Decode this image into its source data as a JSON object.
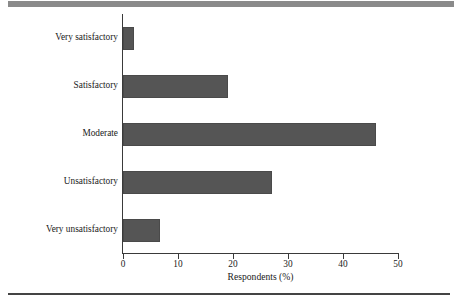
{
  "figure": {
    "background_color": "#ffffff",
    "rules": {
      "top_rule_color": "#8a8a8a",
      "bottom_rule_color": "#444444"
    }
  },
  "chart_data": {
    "type": "bar",
    "orientation": "horizontal",
    "title": "",
    "subtitle": "",
    "xlabel": "Respondents (%)",
    "ylabel": "",
    "categories": [
      "Very satisfactory",
      "Satisfactory",
      "Moderate",
      "Unsatisfactory",
      "Very unsatisfactory"
    ],
    "values": [
      2,
      19,
      46,
      27,
      6.7
    ],
    "xlim": [
      0,
      50
    ],
    "xticks": [
      0,
      10,
      20,
      30,
      40,
      50
    ],
    "xtick_labels": [
      "0",
      "10",
      "20",
      "30",
      "40",
      "50"
    ],
    "grid": false,
    "legend": null,
    "bar_color": "#555555",
    "axis_color": "#3a3a3a"
  }
}
